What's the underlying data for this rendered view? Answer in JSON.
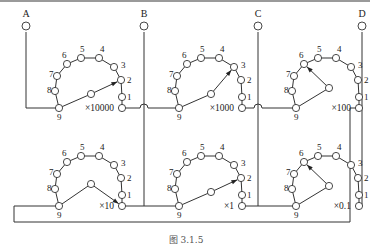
{
  "figure": {
    "caption": "图 3.1.5",
    "terminals": [
      {
        "label": "A"
      },
      {
        "label": "B"
      },
      {
        "label": "C"
      },
      {
        "label": "D"
      }
    ],
    "switches": [
      {
        "multiplier": "×10000",
        "position": 2,
        "contact_labels": [
          "1",
          "2",
          "3",
          "4",
          "5",
          "6",
          "7",
          "8",
          "9"
        ]
      },
      {
        "multiplier": "×1000",
        "position": 3,
        "contact_labels": [
          "1",
          "2",
          "3",
          "4",
          "5",
          "6",
          "7",
          "8",
          "9"
        ]
      },
      {
        "multiplier": "×100",
        "position": 6,
        "contact_labels": [
          "1",
          "2",
          "3",
          "4",
          "5",
          "6",
          "7",
          "8",
          "9"
        ]
      },
      {
        "multiplier": "×10",
        "position": 0,
        "contact_labels": [
          "1",
          "2",
          "3",
          "4",
          "5",
          "6",
          "7",
          "8",
          "9"
        ]
      },
      {
        "multiplier": "×1",
        "position": 2,
        "contact_labels": [
          "1",
          "2",
          "3",
          "4",
          "5",
          "6",
          "7",
          "8",
          "9"
        ]
      },
      {
        "multiplier": "×0.1",
        "position": 6,
        "contact_labels": [
          "1",
          "2",
          "3",
          "4",
          "5",
          "6",
          "7",
          "8",
          "9"
        ]
      }
    ]
  }
}
